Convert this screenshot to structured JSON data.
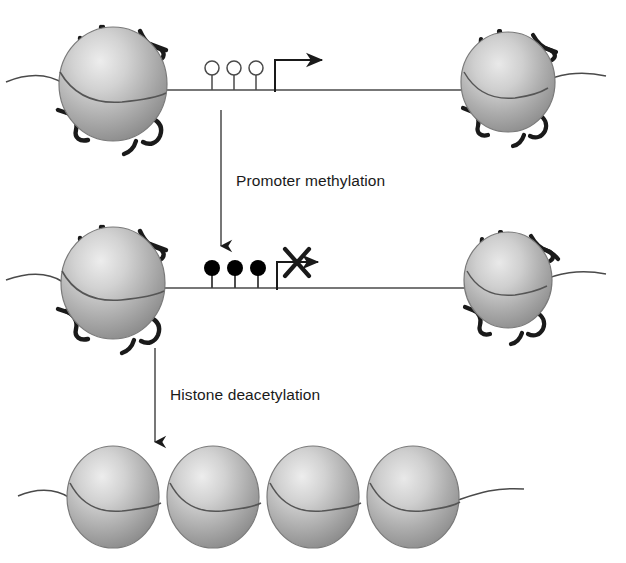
{
  "figure": {
    "type": "biological-diagram",
    "title_visible": false,
    "background_color": "#ffffff",
    "width": 626,
    "height": 563
  },
  "colors": {
    "nucleosome_light": "#e2e2e2",
    "nucleosome_mid": "#b4b4b4",
    "nucleosome_dark": "#8c8c8c",
    "nucleosome_edge": "#6e6e6e",
    "histone_tail": "#1a1a1a",
    "dna_line": "#4a4a4a",
    "marker_open_fill": "#ffffff",
    "marker_filled_fill": "#000000",
    "arrow": "#1a1a1a",
    "text": "#1a1a1a"
  },
  "steps": [
    {
      "id": "promoter-methylation",
      "label": "Promoter methylation",
      "label_x": 236,
      "label_y": 186,
      "arrow_x": 221,
      "arrow_y1": 110,
      "arrow_y2": 250
    },
    {
      "id": "histone-deacetylation",
      "label": "Histone deacetylation",
      "label_x": 170,
      "label_y": 400,
      "arrow_x": 155,
      "arrow_y1": 348,
      "arrow_y2": 446
    }
  ],
  "rows": [
    {
      "id": "row-active-gene",
      "state": "active",
      "description": "Unmethylated promoter with open CpG markers and active transcription",
      "dna_y": 90,
      "nucleosomes": [
        {
          "cx": 113,
          "cy": 84,
          "rx": 54,
          "ry": 57,
          "tails": true
        },
        {
          "cx": 508,
          "cy": 82,
          "rx": 47,
          "ry": 50,
          "tails": true
        }
      ],
      "markers": [
        {
          "cx": 212,
          "cy": 68,
          "r": 7,
          "filled": false
        },
        {
          "cx": 234,
          "cy": 68,
          "r": 7,
          "filled": false
        },
        {
          "cx": 256,
          "cy": 68,
          "r": 7,
          "filled": false
        }
      ],
      "transcription_arrow": {
        "x_start": 275,
        "y_base": 90,
        "y_top": 60,
        "x_end": 330,
        "blocked": false
      }
    },
    {
      "id": "row-methylated-gene",
      "state": "silenced-methylation",
      "description": "Methylated promoter with filled CpG markers and blocked transcription",
      "dna_y": 288,
      "nucleosomes": [
        {
          "cx": 113,
          "cy": 283,
          "rx": 52,
          "ry": 56,
          "tails": true
        },
        {
          "cx": 508,
          "cy": 280,
          "rx": 44,
          "ry": 48,
          "tails": true
        }
      ],
      "markers": [
        {
          "cx": 212,
          "cy": 268,
          "r": 8,
          "filled": true
        },
        {
          "cx": 235,
          "cy": 268,
          "r": 8,
          "filled": true
        },
        {
          "cx": 258,
          "cy": 268,
          "r": 8,
          "filled": true
        }
      ],
      "transcription_arrow": {
        "x_start": 277,
        "y_base": 288,
        "y_top": 262,
        "x_end": 330,
        "blocked": true,
        "cross_cx": 296,
        "cross_cy": 262,
        "cross_size": 15
      }
    },
    {
      "id": "row-condensed-chromatin",
      "state": "silenced-condensed",
      "description": "Deacetylated histones forming closed condensed chromatin",
      "dna_y": 500,
      "nucleosomes": [
        {
          "cx": 113,
          "cy": 497,
          "rx": 46,
          "ry": 51,
          "tails": false
        },
        {
          "cx": 213,
          "cy": 497,
          "rx": 46,
          "ry": 51,
          "tails": false
        },
        {
          "cx": 313,
          "cy": 497,
          "rx": 46,
          "ry": 51,
          "tails": false
        },
        {
          "cx": 413,
          "cy": 497,
          "rx": 46,
          "ry": 51,
          "tails": false
        }
      ],
      "markers": [],
      "transcription_arrow": null
    }
  ]
}
